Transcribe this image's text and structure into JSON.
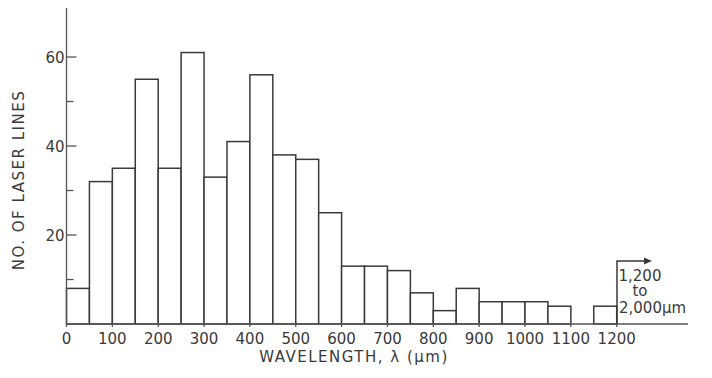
{
  "chart_data": {
    "type": "bar",
    "subtype": "histogram",
    "title": "",
    "xlabel": "WAVELENGTH, λ (μm)",
    "ylabel": "NO. OF LASER LINES",
    "bin_width": 50,
    "bins": [
      {
        "start": 0,
        "end": 50,
        "value": 8
      },
      {
        "start": 50,
        "end": 100,
        "value": 32
      },
      {
        "start": 100,
        "end": 150,
        "value": 35
      },
      {
        "start": 150,
        "end": 200,
        "value": 55
      },
      {
        "start": 200,
        "end": 250,
        "value": 35
      },
      {
        "start": 250,
        "end": 300,
        "value": 61
      },
      {
        "start": 300,
        "end": 350,
        "value": 33
      },
      {
        "start": 350,
        "end": 400,
        "value": 41
      },
      {
        "start": 400,
        "end": 450,
        "value": 56
      },
      {
        "start": 450,
        "end": 500,
        "value": 38
      },
      {
        "start": 500,
        "end": 550,
        "value": 37
      },
      {
        "start": 550,
        "end": 600,
        "value": 25
      },
      {
        "start": 600,
        "end": 650,
        "value": 13
      },
      {
        "start": 650,
        "end": 700,
        "value": 13
      },
      {
        "start": 700,
        "end": 750,
        "value": 12
      },
      {
        "start": 750,
        "end": 800,
        "value": 7
      },
      {
        "start": 800,
        "end": 850,
        "value": 3
      },
      {
        "start": 850,
        "end": 900,
        "value": 8
      },
      {
        "start": 900,
        "end": 950,
        "value": 5
      },
      {
        "start": 950,
        "end": 1000,
        "value": 5
      },
      {
        "start": 1000,
        "end": 1050,
        "value": 5
      },
      {
        "start": 1050,
        "end": 1100,
        "value": 4
      },
      {
        "start": 1100,
        "end": 1150,
        "value": 0
      },
      {
        "start": 1150,
        "end": 1200,
        "value": 4
      }
    ],
    "x_ticks": [
      0,
      100,
      200,
      300,
      400,
      500,
      600,
      700,
      800,
      900,
      1000,
      1100,
      1200
    ],
    "x_tick_labels": [
      "0",
      "100",
      "200",
      "300",
      "400",
      "500",
      "600",
      "700",
      "800",
      "900",
      "1000",
      "1100",
      "1200"
    ],
    "y_ticks": [
      20,
      40,
      60
    ],
    "y_minor_ticks": [
      10,
      30,
      50
    ],
    "y_tick_labels": [
      "20",
      "40",
      "60"
    ],
    "xlim": [
      0,
      1300
    ],
    "ylim": [
      0,
      71
    ],
    "grid": false,
    "legend": null,
    "annotations": [
      {
        "text_lines": [
          "1,200",
          "to",
          "2,000μm"
        ],
        "anchor_x": 1200,
        "description": "arrow pointing right indicating last bin spans 1,200 to 2,000 μm"
      }
    ]
  }
}
